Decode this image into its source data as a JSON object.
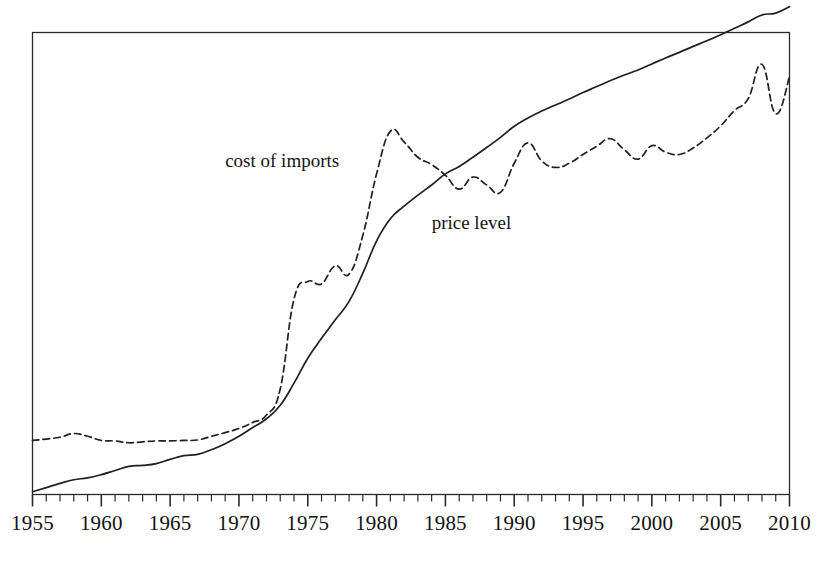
{
  "chart_data": {
    "type": "line",
    "title": "",
    "subtitle": "",
    "xlabel": "",
    "ylabel": "",
    "xlim": [
      1955,
      2010
    ],
    "ylim": [
      0,
      100
    ],
    "grid": false,
    "legend_position": "inline-annotation",
    "axis": {
      "frame": true,
      "tick_labels": [
        "1955",
        "1960",
        "1965",
        "1970",
        "1975",
        "1980",
        "1985",
        "1990",
        "1995",
        "2000",
        "2005",
        "2010"
      ],
      "tick_values": [
        1955,
        1960,
        1965,
        1970,
        1975,
        1980,
        1985,
        1990,
        1995,
        2000,
        2005,
        2010
      ],
      "minor_tick_interval": 1,
      "major_tick_interval": 5,
      "y_tick_labels": []
    },
    "annotations": [
      {
        "name": "cost-of-imports-label",
        "text": "cost of imports",
        "x": 1969.0,
        "y": 72.0
      },
      {
        "name": "price-level-label",
        "text": "price level",
        "x": 1984.0,
        "y": 58.5
      }
    ],
    "series": [
      {
        "name": "cost of imports",
        "style": "dashed",
        "color": "#202020",
        "x": [
          1955,
          1956,
          1957,
          1958,
          1959,
          1960,
          1961,
          1962,
          1963,
          1964,
          1965,
          1966,
          1967,
          1968,
          1969,
          1970,
          1971,
          1972,
          1973,
          1974,
          1975,
          1976,
          1977,
          1978,
          1979,
          1980,
          1981,
          1982,
          1983,
          1984,
          1985,
          1986,
          1987,
          1988,
          1989,
          1990,
          1991,
          1992,
          1993,
          1994,
          1995,
          1996,
          1997,
          1998,
          1999,
          2000,
          2001,
          2002,
          2003,
          2004,
          2005,
          2006,
          2007,
          2008,
          2009,
          2010
        ],
        "values": [
          11.7,
          12.0,
          12.4,
          13.2,
          12.6,
          11.7,
          11.6,
          11.2,
          11.4,
          11.6,
          11.6,
          11.7,
          11.8,
          12.6,
          13.4,
          14.3,
          15.6,
          17.2,
          22.9,
          42.3,
          46.1,
          45.6,
          49.5,
          47.7,
          56.1,
          69.4,
          78.6,
          76.3,
          73.0,
          71.4,
          69.1,
          66.1,
          68.7,
          67.0,
          65.4,
          71.7,
          76.1,
          72.2,
          70.8,
          71.7,
          73.6,
          75.4,
          77.0,
          74.6,
          72.6,
          75.5,
          74.1,
          73.6,
          75.0,
          77.2,
          79.8,
          83.1,
          85.7,
          93.1,
          82.4,
          90.4
        ]
      },
      {
        "name": "price level",
        "style": "solid",
        "color": "#202020",
        "x": [
          1955,
          1956,
          1957,
          1958,
          1959,
          1960,
          1961,
          1962,
          1963,
          1964,
          1965,
          1966,
          1967,
          1968,
          1969,
          1970,
          1971,
          1972,
          1973,
          1974,
          1975,
          1976,
          1977,
          1978,
          1979,
          1980,
          1981,
          1982,
          1983,
          1984,
          1985,
          1986,
          1987,
          1988,
          1989,
          1990,
          1991,
          1992,
          1993,
          1994,
          1995,
          1996,
          1997,
          1998,
          1999,
          2000,
          2001,
          2002,
          2003,
          2004,
          2005,
          2006,
          2007,
          2008,
          2009,
          2010
        ],
        "values": [
          0.6,
          1.5,
          2.4,
          3.2,
          3.6,
          4.3,
          5.2,
          6.1,
          6.3,
          6.7,
          7.6,
          8.4,
          8.7,
          9.7,
          11.0,
          12.6,
          14.5,
          16.4,
          19.3,
          24.1,
          29.5,
          33.8,
          37.8,
          41.8,
          47.9,
          54.9,
          59.7,
          62.4,
          64.8,
          67.0,
          69.4,
          71.0,
          73.0,
          75.1,
          77.3,
          79.7,
          81.5,
          83.0,
          84.3,
          85.6,
          87.0,
          88.3,
          89.6,
          90.8,
          91.9,
          93.2,
          94.5,
          95.7,
          97.0,
          98.2,
          99.5,
          100.9,
          102.3,
          103.8,
          104.2,
          105.6
        ]
      }
    ]
  }
}
